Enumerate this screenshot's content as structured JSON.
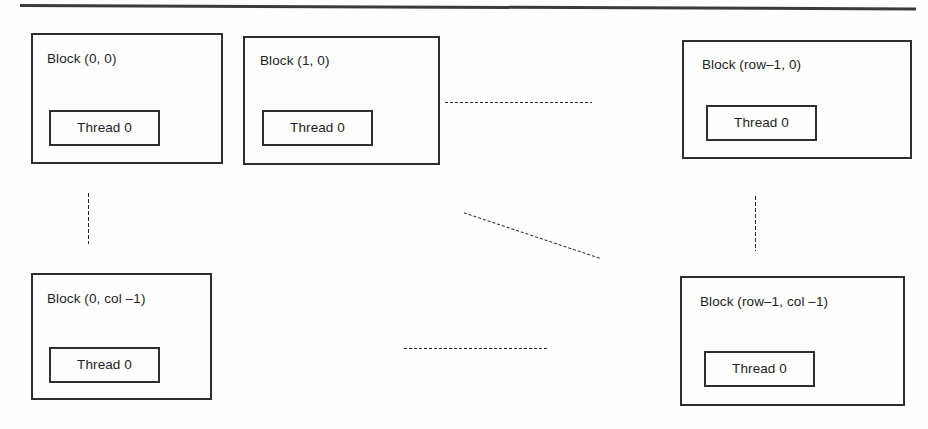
{
  "figure": {
    "type": "diagram",
    "separator_rule": "horizontal-rule"
  },
  "blocks": [
    {
      "id": "block-0-0",
      "label": "Block (0, 0)",
      "thread_label": "Thread 0",
      "x": 31,
      "y": 33,
      "w": 192,
      "h": 131,
      "label_x": 14,
      "label_y": 17,
      "thread_x": 16,
      "thread_y": 75,
      "thread_w": 111,
      "thread_h": 36
    },
    {
      "id": "block-1-0",
      "label": "Block (1, 0)",
      "thread_label": "Thread 0",
      "x": 243,
      "y": 36,
      "w": 197,
      "h": 129,
      "label_x": 15,
      "label_y": 16,
      "thread_x": 17,
      "thread_y": 72,
      "thread_w": 111,
      "thread_h": 36
    },
    {
      "id": "block-row1-0",
      "label": "Block (row–1, 0)",
      "thread_label": "Thread 0",
      "x": 682,
      "y": 40,
      "w": 230,
      "h": 119,
      "label_x": 18,
      "label_y": 16,
      "thread_x": 22,
      "thread_y": 63,
      "thread_w": 111,
      "thread_h": 36
    },
    {
      "id": "block-0-col1",
      "label": "Block (0, col –1)",
      "thread_label": "Thread 0",
      "x": 31,
      "y": 273,
      "w": 181,
      "h": 127,
      "label_x": 14,
      "label_y": 17,
      "thread_x": 16,
      "thread_y": 72,
      "thread_w": 111,
      "thread_h": 36
    },
    {
      "id": "block-row1-col1",
      "label": "Block (row–1, col –1)",
      "thread_label": "Thread 0",
      "x": 680,
      "y": 276,
      "w": 225,
      "h": 130,
      "label_x": 18,
      "label_y": 17,
      "thread_x": 22,
      "thread_y": 73,
      "thread_w": 111,
      "thread_h": 36
    }
  ],
  "ellipses": [
    {
      "id": "dots-top-row",
      "orientation": "horizontal",
      "x": 444,
      "y": 101,
      "length": 148
    },
    {
      "id": "dots-bottom-row",
      "orientation": "horizontal",
      "x": 403,
      "y": 347,
      "length": 146
    },
    {
      "id": "dots-left-col",
      "orientation": "vertical",
      "x": 87,
      "y": 192,
      "length": 52
    },
    {
      "id": "dots-right-col",
      "orientation": "vertical",
      "x": 754,
      "y": 195,
      "length": 56
    },
    {
      "id": "dots-diagonal",
      "orientation": "diagonal",
      "x": 463,
      "y": 211,
      "length": 145,
      "angle": 18.5
    }
  ],
  "colors": {
    "ink": "#2e2e2e",
    "text": "#1d1d1d",
    "paper": "#fefefe",
    "dot": "#262626"
  }
}
